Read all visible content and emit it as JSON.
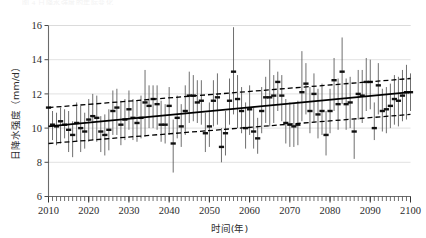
{
  "figure": {
    "caption_remnant": "图 4  日降水强度的年际变化",
    "background_color": "#ffffff"
  },
  "chart_data": {
    "type": "scatter",
    "title": "",
    "subtitle": "",
    "xlabel": "时间(年)",
    "ylabel": "日降水强度（mm/d）",
    "xlim": [
      2010,
      2100
    ],
    "ylim": [
      6,
      16
    ],
    "xticks": [
      2010,
      2020,
      2030,
      2040,
      2050,
      2060,
      2070,
      2080,
      2090,
      2100
    ],
    "yticks": [
      6,
      8,
      10,
      12,
      14,
      16
    ],
    "xtick_labels": [
      "2010",
      "2020",
      "2030",
      "2040",
      "2050",
      "2060",
      "2070",
      "2080",
      "2090",
      "2100"
    ],
    "ytick_labels": [
      "6",
      "8",
      "10",
      "12",
      "14",
      "16"
    ],
    "x_minor_tick_step": 1,
    "grid": "horizontal",
    "grid_color": "#d9d9d9",
    "legend": "none",
    "legend_position": "none",
    "marker_style": "horizontal-dash",
    "marker_color": "#111111",
    "whisker_color": "#555555",
    "annotations": [],
    "series": [
      {
        "name": "年平均日降水强度",
        "type": "scatter-with-errorbars",
        "x": [
          2010,
          2011,
          2012,
          2013,
          2014,
          2015,
          2016,
          2017,
          2018,
          2019,
          2020,
          2021,
          2022,
          2023,
          2024,
          2025,
          2026,
          2027,
          2028,
          2029,
          2030,
          2031,
          2032,
          2033,
          2034,
          2035,
          2036,
          2037,
          2038,
          2039,
          2040,
          2041,
          2042,
          2043,
          2044,
          2045,
          2046,
          2047,
          2048,
          2049,
          2050,
          2051,
          2052,
          2053,
          2054,
          2055,
          2056,
          2057,
          2058,
          2059,
          2060,
          2061,
          2062,
          2063,
          2064,
          2065,
          2066,
          2067,
          2068,
          2069,
          2070,
          2071,
          2072,
          2073,
          2074,
          2075,
          2076,
          2077,
          2078,
          2079,
          2080,
          2081,
          2082,
          2083,
          2084,
          2085,
          2086,
          2087,
          2088,
          2089,
          2090,
          2091,
          2092,
          2093,
          2094,
          2095,
          2096,
          2097,
          2098,
          2099,
          2100
        ],
        "values": [
          11.2,
          10.2,
          10.1,
          10.4,
          10.2,
          9.9,
          9.6,
          10.3,
          10.0,
          9.8,
          10.5,
          10.7,
          10.6,
          9.8,
          9.6,
          9.9,
          11.0,
          11.2,
          10.2,
          10.5,
          11.1,
          10.6,
          10.3,
          10.6,
          11.5,
          11.3,
          11.7,
          11.4,
          10.2,
          10.2,
          11.3,
          9.1,
          10.6,
          10.1,
          11.0,
          11.9,
          11.9,
          11.5,
          11.6,
          9.7,
          10.1,
          11.6,
          11.8,
          8.9,
          9.7,
          11.6,
          13.3,
          11.7,
          11.0,
          10.0,
          11.1,
          9.8,
          9.4,
          11.0,
          11.8,
          11.8,
          11.9,
          12.7,
          11.9,
          10.3,
          10.2,
          10.1,
          10.2,
          12.1,
          12.6,
          11.0,
          12.0,
          10.8,
          11.0,
          9.6,
          11.0,
          12.8,
          11.4,
          13.3,
          11.4,
          11.5,
          9.8,
          12.0,
          11.9,
          12.7,
          12.7,
          10.0,
          12.5,
          11.0,
          11.1,
          11.3,
          11.7,
          11.6,
          11.9,
          12.1,
          12.1
        ],
        "err_low": [
          10.1,
          9.3,
          9.0,
          9.1,
          9.4,
          8.6,
          8.3,
          9.2,
          8.6,
          8.8,
          9.2,
          9.3,
          9.2,
          8.6,
          8.4,
          8.7,
          9.6,
          9.6,
          9.0,
          9.3,
          9.9,
          9.3,
          9.2,
          9.4,
          9.5,
          10.0,
          10.0,
          9.9,
          9.2,
          9.1,
          9.6,
          7.4,
          9.4,
          8.9,
          9.6,
          10.3,
          10.4,
          10.3,
          10.2,
          8.6,
          8.9,
          10.1,
          10.2,
          8.0,
          8.4,
          10.2,
          10.8,
          10.0,
          9.7,
          8.8,
          9.6,
          8.8,
          8.5,
          9.7,
          10.3,
          10.1,
          10.3,
          11.0,
          10.4,
          9.1,
          8.9,
          8.9,
          9.0,
          10.4,
          10.8,
          9.7,
          10.3,
          9.4,
          9.6,
          8.4,
          9.7,
          11.0,
          9.9,
          11.4,
          9.9,
          10.0,
          8.2,
          10.5,
          10.3,
          11.0,
          11.1,
          9.3,
          10.8,
          9.8,
          9.7,
          10.0,
          10.2,
          10.1,
          10.4,
          10.5,
          11.0
        ],
        "err_high": [
          11.9,
          11.0,
          10.9,
          11.2,
          11.1,
          11.0,
          10.4,
          11.5,
          11.3,
          10.9,
          11.7,
          12.0,
          11.9,
          10.7,
          10.8,
          11.1,
          12.2,
          12.3,
          11.6,
          11.7,
          12.2,
          11.7,
          11.6,
          11.9,
          13.4,
          12.5,
          12.5,
          12.5,
          11.6,
          11.4,
          12.4,
          10.5,
          11.9,
          11.4,
          12.5,
          13.3,
          13.1,
          12.8,
          12.8,
          10.9,
          11.5,
          12.8,
          13.2,
          10.0,
          11.0,
          12.9,
          15.9,
          13.1,
          12.4,
          11.5,
          12.5,
          11.2,
          10.6,
          12.4,
          13.0,
          14.0,
          13.1,
          13.3,
          13.1,
          11.7,
          11.5,
          11.4,
          11.6,
          14.5,
          13.8,
          12.4,
          13.2,
          12.3,
          12.6,
          11.0,
          12.3,
          14.1,
          12.9,
          15.3,
          12.9,
          13.0,
          10.5,
          13.4,
          13.4,
          14.1,
          14.0,
          11.5,
          13.8,
          12.3,
          12.4,
          12.6,
          13.1,
          13.0,
          13.4,
          13.7,
          13.2
        ]
      },
      {
        "name": "线性趋势",
        "type": "line",
        "style": "solid",
        "color": "#000000",
        "x": [
          2010,
          2100
        ],
        "values": [
          10.1,
          12.1
        ]
      },
      {
        "name": "置信区间上界",
        "type": "line",
        "style": "dashed",
        "color": "#000000",
        "x": [
          2010,
          2100
        ],
        "values": [
          11.2,
          12.9
        ]
      },
      {
        "name": "置信区间下界",
        "type": "line",
        "style": "dashed",
        "color": "#000000",
        "x": [
          2010,
          2100
        ],
        "values": [
          9.1,
          10.8
        ]
      }
    ]
  }
}
